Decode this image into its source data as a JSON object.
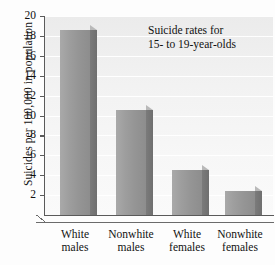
{
  "chart_data": {
    "type": "bar",
    "title": "",
    "annotation": [
      "Suicide rates for",
      "15- to 19-year-olds"
    ],
    "categories": [
      "White males",
      "Nonwhite males",
      "White females",
      "Nonwhite females"
    ],
    "category_lines": [
      [
        "White",
        "males"
      ],
      [
        "Nonwhite",
        "males"
      ],
      [
        "White",
        "females"
      ],
      [
        "Nonwhite",
        "females"
      ]
    ],
    "values": [
      18.6,
      10.6,
      4.5,
      2.4
    ],
    "xlabel": "",
    "ylabel": "Suicides per 100,000 in population",
    "ylim": [
      0,
      20
    ],
    "ytick_values": [
      2,
      4,
      6,
      8,
      10,
      12,
      14,
      16,
      18,
      20
    ],
    "ytick_labels": [
      "2",
      "4",
      "6",
      "8",
      "10",
      "12",
      "14",
      "16",
      "18",
      "20"
    ],
    "grid": true,
    "grid_axis": "y",
    "legend": false,
    "bar_style": "3d",
    "colors": {
      "bar_front_light": "#a9a9a9",
      "bar_front_dark": "#8d8d8d",
      "bar_side": "#6f6f6f",
      "bar_top": "#b9b9b9",
      "axis": "#5a5a5a",
      "plot_background": "#f2f2f2",
      "gridline": "#ffffff",
      "text": "#111111"
    }
  }
}
